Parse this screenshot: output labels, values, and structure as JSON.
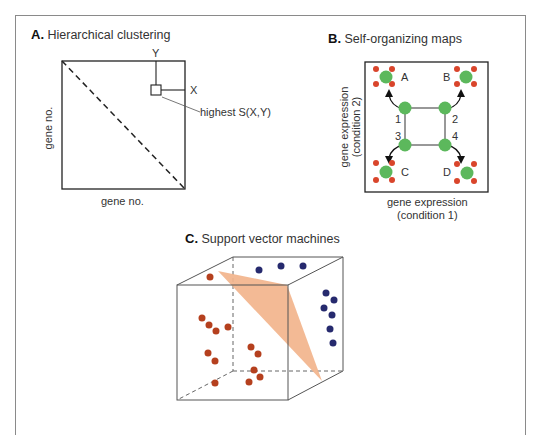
{
  "panelA": {
    "letter": "A.",
    "title": "Hierarchical clustering",
    "x_axis_label": "gene no.",
    "y_axis_label": "gene no.",
    "marker_x_label": "X",
    "marker_y_label": "Y",
    "callout_label": "highest S(X,Y)"
  },
  "panelB": {
    "letter": "B.",
    "title": "Self-organizing maps",
    "x_axis_label_line1": "gene expression",
    "x_axis_label_line2": "(condition 1)",
    "y_axis_label_line1": "gene expression",
    "y_axis_label_line2": "(condition 2)",
    "node_labels": [
      "1",
      "2",
      "3",
      "4"
    ],
    "cluster_labels": [
      "A",
      "B",
      "C",
      "D"
    ],
    "colors": {
      "node": "#5cb85c",
      "gene": "#d9452b",
      "arrow": "#111111"
    }
  },
  "panelC": {
    "letter": "C.",
    "title": "Support vector machines",
    "colors": {
      "class1": "#b5401e",
      "class2": "#262a6e",
      "hyperplane": "#f2b48c"
    },
    "class1_count": 13,
    "class2_count": 9
  }
}
